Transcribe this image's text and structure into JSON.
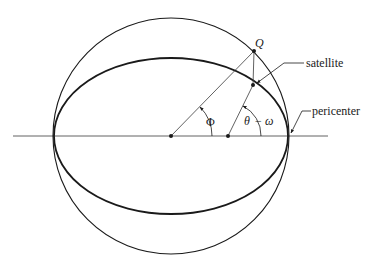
{
  "figure": {
    "type": "orbital-geometry-diagram"
  },
  "labels": {
    "q_point": "Q",
    "satellite": "satellite",
    "pericenter": "pericenter",
    "eccentric_anomaly": "Φ",
    "true_anomaly_theta": "θ",
    "true_anomaly_minus": "−",
    "true_anomaly_omega": "ω"
  },
  "geometry": {
    "center": [
      171,
      136
    ],
    "focus": [
      228,
      136
    ],
    "circle_radius": 118,
    "ellipse_semi_major": 117,
    "ellipse_semi_minor": 78,
    "q_point": [
      254,
      51
    ],
    "satellite_point": [
      253,
      85
    ],
    "pericenter_point": [
      288,
      136
    ],
    "axis_line": {
      "x1": 13,
      "x2": 328,
      "y": 136
    }
  },
  "colors": {
    "ink": "#1a1a1a",
    "thin_line": "#3a3a3a",
    "background": "#ffffff"
  }
}
